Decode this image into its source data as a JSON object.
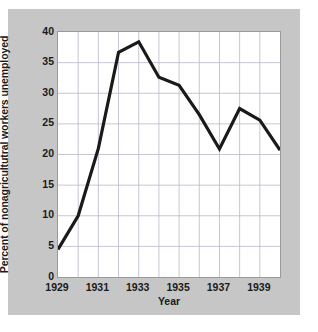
{
  "chart_data": {
    "type": "line",
    "title": "",
    "xlabel": "Year",
    "ylabel": "Percent of nonagricultutral workers unemployed",
    "x": [
      1929,
      1930,
      1931,
      1932,
      1933,
      1934,
      1935,
      1936,
      1937,
      1938,
      1939,
      1940
    ],
    "values": [
      4.5,
      10.0,
      21.0,
      36.7,
      38.4,
      32.6,
      31.3,
      26.5,
      20.9,
      27.5,
      25.6,
      20.7
    ],
    "series": [
      {
        "name": "Percent unemployed",
        "values": [
          4.5,
          10.0,
          21.0,
          36.7,
          38.4,
          32.6,
          31.3,
          26.5,
          20.9,
          27.5,
          25.6,
          20.7
        ]
      }
    ],
    "xlim": [
      1929,
      1940
    ],
    "ylim": [
      0,
      40
    ],
    "yticks": [
      0,
      5,
      10,
      15,
      20,
      25,
      30,
      35,
      40
    ],
    "ytick_labels": [
      "0",
      "5",
      "10",
      "15",
      "20",
      "25",
      "30",
      "35",
      "40"
    ],
    "xticks": [
      1929,
      1931,
      1933,
      1935,
      1937,
      1939
    ],
    "xtick_labels": [
      "1929",
      "1931",
      "1933",
      "1935",
      "1937",
      "1939"
    ],
    "grid": true,
    "legend": "none",
    "line_color": "#1a1a1a",
    "grid_color": "#b9b9c9",
    "plot_bg": "#ffffff",
    "figure_bg": "#c6c6c6"
  }
}
